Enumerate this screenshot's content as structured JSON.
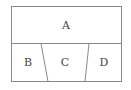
{
  "diagram": {
    "regions": [
      {
        "id": "A",
        "label": "A"
      },
      {
        "id": "B",
        "label": "B"
      },
      {
        "id": "C",
        "label": "C"
      },
      {
        "id": "D",
        "label": "D"
      }
    ],
    "colors": {
      "stroke": "#888888",
      "text": "#444444",
      "background": "#ffffff"
    }
  }
}
